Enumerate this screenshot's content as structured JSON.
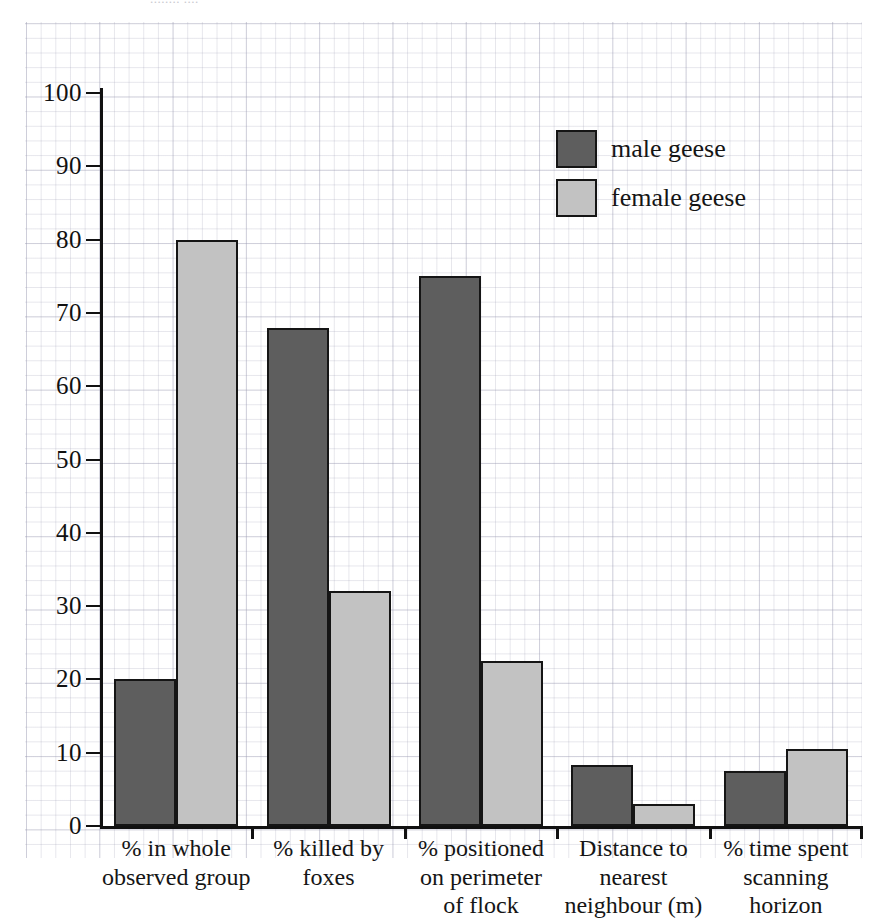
{
  "figure": {
    "caption_fragment": "........ ....",
    "background": "graph-paper"
  },
  "colors": {
    "male_fill": "#5e5e5e",
    "female_fill": "#c2c2c2",
    "outline": "#151515",
    "axis": "#111111",
    "grid_major": "#9696af",
    "grid_minor": "#7878964d"
  },
  "legend": {
    "position": "top-right",
    "entries": [
      {
        "label": "male geese",
        "color": "#5e5e5e",
        "swatch": "male"
      },
      {
        "label": "female geese",
        "color": "#c2c2c2",
        "swatch": "female"
      }
    ]
  },
  "y_axis": {
    "ticks": [
      "0",
      "10",
      "20",
      "30",
      "40",
      "50",
      "60",
      "70",
      "80",
      "90",
      "100"
    ],
    "min": 0,
    "max": 100,
    "step": 10,
    "label": ""
  },
  "x_axis": {
    "categories": [
      {
        "lines": [
          "%  in whole",
          "observed group"
        ]
      },
      {
        "lines": [
          "% killed by",
          "foxes"
        ]
      },
      {
        "lines": [
          "% positioned",
          "on perimeter",
          "of flock"
        ]
      },
      {
        "lines": [
          "Distance to",
          "nearest",
          "neighbour (m)"
        ]
      },
      {
        "lines": [
          "% time spent",
          "scanning",
          "horizon"
        ]
      }
    ]
  },
  "chart_data": {
    "type": "bar",
    "title": "",
    "xlabel": "",
    "ylabel": "",
    "ylim": [
      0,
      100
    ],
    "ytick_step": 10,
    "grid": true,
    "legend_position": "top-right",
    "categories": [
      "%  in whole observed group",
      "% killed by foxes",
      "% positioned on perimeter of flock",
      "Distance to nearest neighbour (m)",
      "% time spent scanning horizon"
    ],
    "series": [
      {
        "name": "male geese",
        "color": "#5e5e5e",
        "values": [
          20,
          68,
          75,
          8.3,
          7.5
        ]
      },
      {
        "name": "female geese",
        "color": "#c2c2c2",
        "values": [
          80,
          32,
          22.5,
          3,
          10.5
        ]
      }
    ]
  }
}
